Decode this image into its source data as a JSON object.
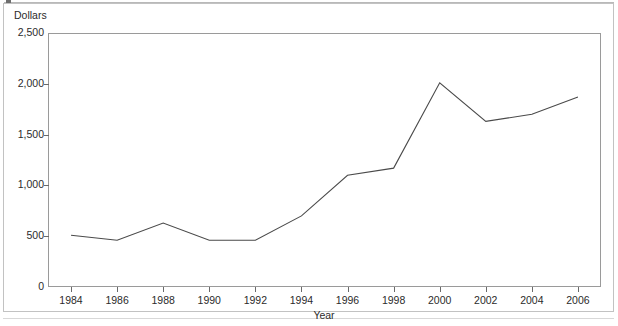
{
  "figure": {
    "y_axis_title": "Dollars",
    "x_axis_title": "Year"
  },
  "chart_data": {
    "type": "line",
    "title": "",
    "subtitle": "",
    "xlabel": "Year",
    "ylabel": "Dollars",
    "categories": [
      "1984",
      "1986",
      "1988",
      "1990",
      "1992",
      "1994",
      "1996",
      "1998",
      "2000",
      "2002",
      "2004",
      "2006"
    ],
    "x": [
      1984,
      1986,
      1988,
      1990,
      1992,
      1994,
      1996,
      1998,
      2000,
      2002,
      2004,
      2006
    ],
    "values": [
      510,
      460,
      630,
      460,
      460,
      700,
      1100,
      1170,
      2010,
      1630,
      1700,
      1870
    ],
    "series": [
      {
        "name": "Dollars",
        "values": [
          510,
          460,
          630,
          460,
          460,
          700,
          1100,
          1170,
          2010,
          1630,
          1700,
          1870
        ]
      }
    ],
    "xlim": [
      1983,
      2007
    ],
    "ylim": [
      0,
      2500
    ],
    "ytick_values": [
      0,
      500,
      1000,
      1500,
      2000,
      2500
    ],
    "ytick_labels": [
      "0",
      "500",
      "1,000",
      "1,500",
      "2,000",
      "2,500"
    ],
    "xtick_labels": [
      "1984",
      "1986",
      "1988",
      "1990",
      "1992",
      "1994",
      "1996",
      "1998",
      "2000",
      "2002",
      "2004",
      "2006"
    ],
    "grid": false,
    "legend": null,
    "legend_position": "none",
    "line_color": "#4a4a4a",
    "frame_color": "#9a9a9a",
    "background_color": "#ffffff",
    "annotations": []
  }
}
